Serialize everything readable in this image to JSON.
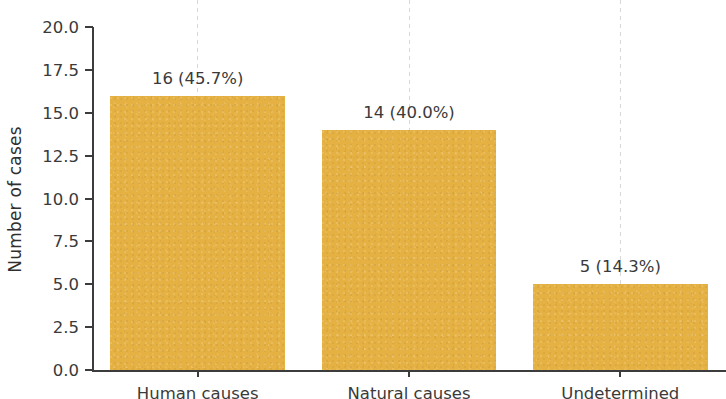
{
  "chart_data": {
    "type": "bar",
    "title": "",
    "xlabel": "",
    "ylabel": "Number of cases",
    "categories": [
      "Human causes",
      "Natural causes",
      "Undetermined"
    ],
    "values": [
      16,
      14,
      5
    ],
    "percentages": [
      "45.7%",
      "40.0%",
      "14.3%"
    ],
    "bar_labels": [
      "16 (45.7%)",
      "14 (40.0%)",
      "5 (14.3%)"
    ],
    "ylim": [
      0,
      20
    ],
    "yticks": [
      "0.0",
      "2.5",
      "5.0",
      "7.5",
      "10.0",
      "12.5",
      "15.0",
      "17.5",
      "20.0"
    ],
    "ytick_values": [
      0,
      2.5,
      5,
      7.5,
      10,
      12.5,
      15,
      17.5,
      20
    ],
    "grid": "vertical-dashed",
    "legend": "none",
    "bar_color": "#e5b143",
    "axis_color": "#3c3c3c",
    "text_color": "#3a3a3a",
    "gridline_color": "#d8d8d8",
    "total_cases": 35
  }
}
